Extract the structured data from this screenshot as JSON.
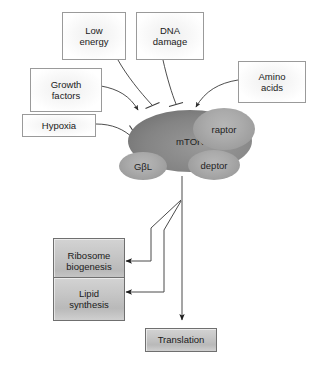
{
  "diagram": {
    "colors": {
      "line": "#3a3a3a",
      "input_box_border": "#9a9a9a",
      "output_box_border": "#6f6f6f",
      "mtor_fill": "#848484",
      "subunit_fill": "#a8a8a8",
      "background": "#ffffff"
    },
    "inputs": [
      {
        "id": "low-energy",
        "label": "Low\nenergy",
        "line1": "Low",
        "line2": "energy",
        "effect": "inhibition"
      },
      {
        "id": "dna-damage",
        "label": "DNA\ndamage",
        "line1": "DNA",
        "line2": "damage",
        "effect": "inhibition"
      },
      {
        "id": "growth-factors",
        "label": "Growth\nfactors",
        "line1": "Growth",
        "line2": "factors",
        "effect": "activation"
      },
      {
        "id": "hypoxia",
        "label": "Hypoxia",
        "line1": "Hypoxia",
        "line2": "",
        "effect": "inhibition"
      },
      {
        "id": "amino-acids",
        "label": "Amino\nacids",
        "line1": "Amino",
        "line2": "acids",
        "effect": "activation"
      }
    ],
    "complex": {
      "core": {
        "id": "mtor",
        "label": "mTOR"
      },
      "subunits": [
        {
          "id": "raptor",
          "label": "raptor"
        },
        {
          "id": "gbl",
          "label": "GβL"
        },
        {
          "id": "deptor",
          "label": "deptor"
        }
      ]
    },
    "outputs": [
      {
        "id": "ribosome-biogenesis",
        "line1": "Ribosome",
        "line2": "biogenesis",
        "effect": "activation"
      },
      {
        "id": "lipid-synthesis",
        "line1": "Lipid",
        "line2": "synthesis",
        "effect": "activation"
      },
      {
        "id": "translation",
        "line1": "Translation",
        "line2": "",
        "effect": "activation"
      }
    ]
  }
}
